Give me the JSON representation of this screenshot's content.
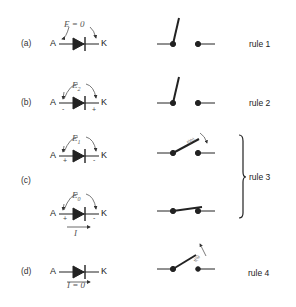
{
  "rows": [
    {
      "label": "(a)",
      "anode": "A",
      "cathode": "K",
      "voltage_label": "E = 0",
      "anode_sign": "",
      "cathode_sign": "",
      "current_label": "",
      "switch_state": "open-up",
      "rule": "rule 1"
    },
    {
      "label": "(b)",
      "anode": "A",
      "cathode": "K",
      "voltage_label": "E",
      "voltage_sub": "2",
      "anode_sign": "-",
      "cathode_sign": "+",
      "current_label": "",
      "switch_state": "open-up",
      "rule": "rule 2"
    },
    {
      "label": "(c)",
      "anode": "A",
      "cathode": "K",
      "voltage_label": "E",
      "voltage_sub": "1",
      "anode_sign": "+",
      "cathode_sign": "-",
      "current_label": "",
      "switch_state": "closing",
      "switch_annotation": "t(th)",
      "rule": "rule 3"
    },
    {
      "label": "",
      "anode": "A",
      "cathode": "K",
      "voltage_label": "E",
      "voltage_sub": "0",
      "anode_sign": "+",
      "cathode_sign": "-",
      "current_label": "I",
      "switch_state": "closed",
      "rule": ""
    },
    {
      "label": "(d)",
      "anode": "A",
      "cathode": "K",
      "voltage_label": "",
      "anode_sign": "",
      "cathode_sign": "",
      "current_label": "I = 0",
      "switch_state": "opening",
      "switch_annotation": "t(q)",
      "rule": "rule 4"
    }
  ],
  "group_rule": "rule 3",
  "colors": {
    "ink": "#222222",
    "arc": "#555555"
  }
}
